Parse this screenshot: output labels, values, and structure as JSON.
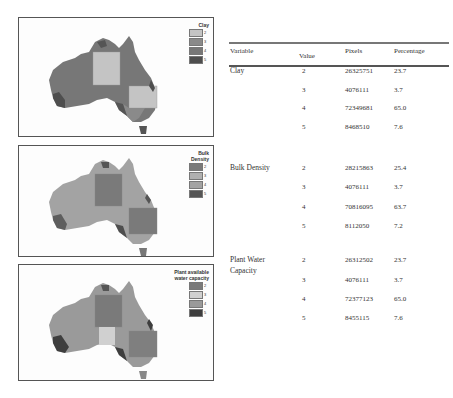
{
  "maps": [
    {
      "title": "Clay",
      "legend": [
        {
          "value": "2",
          "color": "#c4c4c4"
        },
        {
          "value": "3",
          "color": "#8a8a8a"
        },
        {
          "value": "4",
          "color": "#777777"
        },
        {
          "value": "5",
          "color": "#4e4e4e"
        }
      ]
    },
    {
      "title_line1": "Bulk",
      "title_line2": "Density",
      "legend": [
        {
          "value": "2",
          "color": "#7a7a7a"
        },
        {
          "value": "3",
          "color": "#b0b0b0"
        },
        {
          "value": "4",
          "color": "#a3a3a3"
        },
        {
          "value": "5",
          "color": "#555555"
        }
      ]
    },
    {
      "title_line1": "Plant available",
      "title_line2": "water capacity",
      "legend": [
        {
          "value": "2",
          "color": "#7a7a7a"
        },
        {
          "value": "3",
          "color": "#d0d0d0"
        },
        {
          "value": "4",
          "color": "#9a9a9a"
        },
        {
          "value": "5",
          "color": "#3e3e3e"
        }
      ]
    }
  ],
  "table": {
    "headers": {
      "variable": "Variable",
      "value": "Value",
      "pixels": "Pixels",
      "percentage": "Percentage"
    },
    "groups": [
      {
        "variable_line1": "Clay",
        "variable_line2": "",
        "rows": [
          {
            "value": "2",
            "pixels": "26325751",
            "percentage": "23.7"
          },
          {
            "value": "3",
            "pixels": "4076111",
            "percentage": "3.7"
          },
          {
            "value": "4",
            "pixels": "72349681",
            "percentage": "65.0"
          },
          {
            "value": "5",
            "pixels": "8468510",
            "percentage": "7.6"
          }
        ]
      },
      {
        "variable_line1": "Bulk Density",
        "variable_line2": "",
        "rows": [
          {
            "value": "2",
            "pixels": "28215863",
            "percentage": "25.4"
          },
          {
            "value": "3",
            "pixels": "4076111",
            "percentage": "3.7"
          },
          {
            "value": "4",
            "pixels": "70816095",
            "percentage": "63.7"
          },
          {
            "value": "5",
            "pixels": "8112050",
            "percentage": "7.2"
          }
        ]
      },
      {
        "variable_line1": "Plant Water",
        "variable_line2": "Capacity",
        "rows": [
          {
            "value": "2",
            "pixels": "26312502",
            "percentage": "23.7"
          },
          {
            "value": "3",
            "pixels": "4076111",
            "percentage": "3.7"
          },
          {
            "value": "4",
            "pixels": "72377123",
            "percentage": "65.0"
          },
          {
            "value": "5",
            "pixels": "8455115",
            "percentage": "7.6"
          }
        ]
      }
    ]
  }
}
